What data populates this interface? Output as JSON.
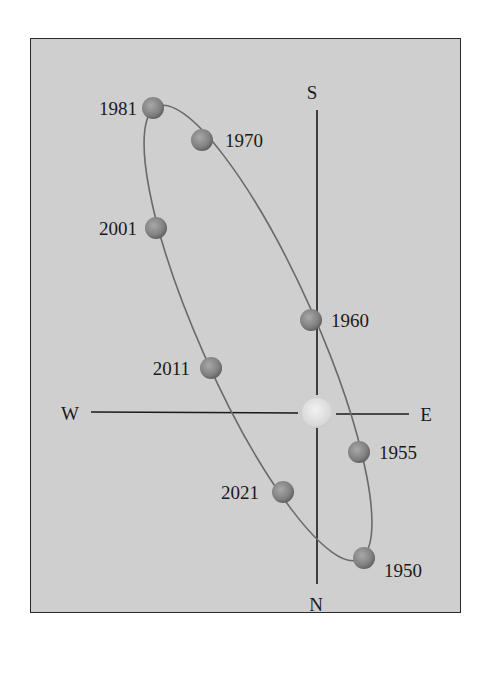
{
  "diagram": {
    "type": "orbit-diagram",
    "background_color": "#cfcfcf",
    "axes": {
      "top_label": "S",
      "bottom_label": "N",
      "left_label": "W",
      "right_label": "E"
    },
    "center_body": {
      "name": "sun",
      "color": "#e0e0e0"
    },
    "orbit_color": "#6a6a6a",
    "ball_color": "#8c8c8c",
    "points": [
      {
        "year": "1981",
        "x": 152,
        "y": 108,
        "label_side": "left"
      },
      {
        "year": "1970",
        "x": 202,
        "y": 140,
        "label_side": "right"
      },
      {
        "year": "2001",
        "x": 155,
        "y": 227,
        "label_side": "left"
      },
      {
        "year": "1960",
        "x": 311,
        "y": 320,
        "label_side": "right"
      },
      {
        "year": "2011",
        "x": 211,
        "y": 368,
        "label_side": "left"
      },
      {
        "year": "1955",
        "x": 359,
        "y": 452,
        "label_side": "right"
      },
      {
        "year": "2021",
        "x": 283,
        "y": 492,
        "label_side": "left"
      },
      {
        "year": "1950",
        "x": 364,
        "y": 558,
        "label_side": "right"
      }
    ]
  }
}
